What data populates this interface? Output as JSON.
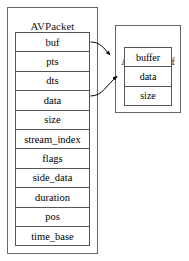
{
  "diagram": {
    "background_color": "#ffffff",
    "line_color": "#555555",
    "text_color": "#000000"
  },
  "packet": {
    "title": "AVPacket",
    "fields": [
      {
        "name": "buf"
      },
      {
        "name": "pts"
      },
      {
        "name": "dts"
      },
      {
        "name": "data"
      },
      {
        "name": "size"
      },
      {
        "name": "stream_index"
      },
      {
        "name": "flags"
      },
      {
        "name": "side_data"
      },
      {
        "name": "duration"
      },
      {
        "name": "pos"
      },
      {
        "name": "time_base"
      }
    ]
  },
  "bufferref": {
    "title": "AVBufferRef",
    "fields": [
      {
        "name": "buffer"
      },
      {
        "name": "data"
      },
      {
        "name": "size"
      }
    ]
  },
  "arrows": [
    {
      "id": "buf-to-buffer",
      "from": "packet.buf",
      "to": "bufferref.top"
    },
    {
      "id": "data-to-data",
      "from": "packet.data",
      "to": "bufferref.data"
    }
  ]
}
